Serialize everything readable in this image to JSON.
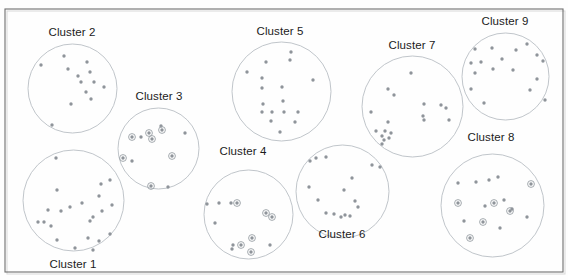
{
  "figure": {
    "title": "",
    "background_color": "#fefefe",
    "frame_color": "#6e6e6e",
    "outline_color": "#b9bec4",
    "dot_color": "#8f949a",
    "ring_color": "#9aa0a6",
    "label_color": "#1b1b1b",
    "frame": {
      "x": 5,
      "y": 9,
      "width": 558,
      "height": 263
    }
  },
  "labels": {
    "cluster1": "Cluster 1",
    "cluster2": "Cluster 2",
    "cluster3": "Cluster 3",
    "cluster4": "Cluster 4",
    "cluster5": "Cluster 5",
    "cluster6": "Cluster 6",
    "cluster7": "Cluster 7",
    "cluster8": "Cluster 8",
    "cluster9": "Cluster 9"
  },
  "chart_data": {
    "type": "scatter",
    "title": "",
    "xlabel": "",
    "ylabel": "",
    "grid": false,
    "legend": "none",
    "xlim": [
      0,
      568
    ],
    "ylim": [
      0,
      280
    ],
    "note": "Nine circular cluster boundaries each enclosing scatter points; some points carry an outer ring marker.",
    "series": [
      {
        "name": "Cluster 1",
        "label": "Cluster 1",
        "label_pos": {
          "x": 73,
          "y": 268
        },
        "circle": {
          "cx": 73.5,
          "cy": 200.5,
          "r": 50.5
        },
        "points": [
          {
            "x": 56,
            "y": 158,
            "ring": false
          },
          {
            "x": 110,
            "y": 180,
            "ring": false
          },
          {
            "x": 101,
            "y": 184,
            "ring": false
          },
          {
            "x": 57,
            "y": 190,
            "ring": false
          },
          {
            "x": 82,
            "y": 203,
            "ring": false
          },
          {
            "x": 99,
            "y": 196,
            "ring": false
          },
          {
            "x": 48,
            "y": 210,
            "ring": false
          },
          {
            "x": 70,
            "y": 207,
            "ring": false
          },
          {
            "x": 61,
            "y": 211,
            "ring": false
          },
          {
            "x": 112,
            "y": 205,
            "ring": false
          },
          {
            "x": 102,
            "y": 211,
            "ring": false
          },
          {
            "x": 93,
            "y": 217,
            "ring": false
          },
          {
            "x": 90,
            "y": 221,
            "ring": false
          },
          {
            "x": 38,
            "y": 222,
            "ring": false
          },
          {
            "x": 44,
            "y": 222,
            "ring": false
          },
          {
            "x": 51,
            "y": 226,
            "ring": false
          },
          {
            "x": 110,
            "y": 234,
            "ring": false
          },
          {
            "x": 88,
            "y": 238,
            "ring": false
          },
          {
            "x": 99,
            "y": 241,
            "ring": false
          },
          {
            "x": 57,
            "y": 240,
            "ring": false
          },
          {
            "x": 93,
            "y": 250,
            "ring": false
          },
          {
            "x": 75,
            "y": 248,
            "ring": false
          }
        ]
      },
      {
        "name": "Cluster 2",
        "label": "Cluster 2",
        "label_pos": {
          "x": 72,
          "y": 36
        },
        "circle": {
          "cx": 72.5,
          "cy": 88.5,
          "r": 44.5
        },
        "points": [
          {
            "x": 64,
            "y": 56,
            "ring": false
          },
          {
            "x": 41,
            "y": 65,
            "ring": false
          },
          {
            "x": 68,
            "y": 69,
            "ring": false
          },
          {
            "x": 87,
            "y": 62,
            "ring": false
          },
          {
            "x": 78,
            "y": 76,
            "ring": false
          },
          {
            "x": 90,
            "y": 72,
            "ring": false
          },
          {
            "x": 81,
            "y": 82,
            "ring": false
          },
          {
            "x": 94,
            "y": 82,
            "ring": false
          },
          {
            "x": 104,
            "y": 87,
            "ring": false
          },
          {
            "x": 86,
            "y": 92,
            "ring": false
          },
          {
            "x": 91,
            "y": 99,
            "ring": false
          },
          {
            "x": 71,
            "y": 104,
            "ring": false
          },
          {
            "x": 52,
            "y": 125,
            "ring": false
          }
        ]
      },
      {
        "name": "Cluster 3",
        "label": "Cluster 3",
        "label_pos": {
          "x": 159,
          "y": 100
        },
        "circle": {
          "cx": 158.5,
          "cy": 148.5,
          "r": 40.5
        },
        "points": [
          {
            "x": 161,
            "y": 126,
            "ring": false
          },
          {
            "x": 162,
            "y": 130,
            "ring": true
          },
          {
            "x": 149,
            "y": 133,
            "ring": true
          },
          {
            "x": 132,
            "y": 137,
            "ring": true
          },
          {
            "x": 141,
            "y": 137,
            "ring": false
          },
          {
            "x": 152,
            "y": 139,
            "ring": true
          },
          {
            "x": 185,
            "y": 133,
            "ring": false
          },
          {
            "x": 123,
            "y": 158,
            "ring": true
          },
          {
            "x": 132,
            "y": 161,
            "ring": false
          },
          {
            "x": 172,
            "y": 156,
            "ring": true
          },
          {
            "x": 151,
            "y": 186,
            "ring": true
          },
          {
            "x": 168,
            "y": 187,
            "ring": false
          }
        ]
      },
      {
        "name": "Cluster 4",
        "label": "Cluster 4",
        "label_pos": {
          "x": 243,
          "y": 155
        },
        "circle": {
          "cx": 248.5,
          "cy": 214.5,
          "r": 44.5
        },
        "points": [
          {
            "x": 207,
            "y": 204,
            "ring": false
          },
          {
            "x": 219,
            "y": 203,
            "ring": false
          },
          {
            "x": 231,
            "y": 203,
            "ring": false
          },
          {
            "x": 237,
            "y": 203,
            "ring": true
          },
          {
            "x": 266,
            "y": 213,
            "ring": true
          },
          {
            "x": 272,
            "y": 217,
            "ring": true
          },
          {
            "x": 215,
            "y": 223,
            "ring": false
          },
          {
            "x": 252,
            "y": 238,
            "ring": true
          },
          {
            "x": 233,
            "y": 245,
            "ring": false
          },
          {
            "x": 241,
            "y": 245,
            "ring": true
          },
          {
            "x": 232,
            "y": 249,
            "ring": false
          },
          {
            "x": 251,
            "y": 252,
            "ring": true
          },
          {
            "x": 270,
            "y": 245,
            "ring": false
          }
        ]
      },
      {
        "name": "Cluster 5",
        "label": "Cluster 5",
        "label_pos": {
          "x": 280,
          "y": 35
        },
        "circle": {
          "cx": 281.5,
          "cy": 91.5,
          "r": 49.5
        },
        "points": [
          {
            "x": 291,
            "y": 52,
            "ring": false
          },
          {
            "x": 290,
            "y": 60,
            "ring": false
          },
          {
            "x": 266,
            "y": 62,
            "ring": false
          },
          {
            "x": 247,
            "y": 72,
            "ring": false
          },
          {
            "x": 262,
            "y": 78,
            "ring": false
          },
          {
            "x": 313,
            "y": 80,
            "ring": false
          },
          {
            "x": 262,
            "y": 88,
            "ring": false
          },
          {
            "x": 282,
            "y": 87,
            "ring": false
          },
          {
            "x": 283,
            "y": 101,
            "ring": false
          },
          {
            "x": 263,
            "y": 104,
            "ring": false
          },
          {
            "x": 262,
            "y": 112,
            "ring": false
          },
          {
            "x": 272,
            "y": 112,
            "ring": false
          },
          {
            "x": 284,
            "y": 112,
            "ring": false
          },
          {
            "x": 298,
            "y": 112,
            "ring": false
          },
          {
            "x": 271,
            "y": 121,
            "ring": false
          },
          {
            "x": 295,
            "y": 122,
            "ring": false
          },
          {
            "x": 280,
            "y": 132,
            "ring": false
          }
        ]
      },
      {
        "name": "Cluster 6",
        "label": "Cluster 6",
        "label_pos": {
          "x": 342,
          "y": 238
        },
        "circle": {
          "cx": 342.5,
          "cy": 191.5,
          "r": 46.5
        },
        "points": [
          {
            "x": 310,
            "y": 161,
            "ring": false
          },
          {
            "x": 316,
            "y": 158,
            "ring": false
          },
          {
            "x": 326,
            "y": 157,
            "ring": false
          },
          {
            "x": 372,
            "y": 165,
            "ring": false
          },
          {
            "x": 380,
            "y": 167,
            "ring": false
          },
          {
            "x": 352,
            "y": 178,
            "ring": false
          },
          {
            "x": 309,
            "y": 187,
            "ring": false
          },
          {
            "x": 344,
            "y": 190,
            "ring": false
          },
          {
            "x": 318,
            "y": 200,
            "ring": false
          },
          {
            "x": 355,
            "y": 201,
            "ring": false
          },
          {
            "x": 358,
            "y": 207,
            "ring": false
          },
          {
            "x": 326,
            "y": 213,
            "ring": false
          },
          {
            "x": 334,
            "y": 214,
            "ring": false
          },
          {
            "x": 341,
            "y": 217,
            "ring": false
          },
          {
            "x": 345,
            "y": 215,
            "ring": false
          },
          {
            "x": 350,
            "y": 216,
            "ring": false
          }
        ]
      },
      {
        "name": "Cluster 7",
        "label": "Cluster 7",
        "label_pos": {
          "x": 412,
          "y": 49
        },
        "circle": {
          "cx": 412.5,
          "cy": 106.5,
          "r": 50.5
        },
        "points": [
          {
            "x": 411,
            "y": 73,
            "ring": false
          },
          {
            "x": 388,
            "y": 89,
            "ring": false
          },
          {
            "x": 394,
            "y": 95,
            "ring": false
          },
          {
            "x": 424,
            "y": 104,
            "ring": false
          },
          {
            "x": 441,
            "y": 105,
            "ring": false
          },
          {
            "x": 446,
            "y": 108,
            "ring": false
          },
          {
            "x": 371,
            "y": 112,
            "ring": false
          },
          {
            "x": 423,
            "y": 116,
            "ring": false
          },
          {
            "x": 424,
            "y": 120,
            "ring": false
          },
          {
            "x": 449,
            "y": 120,
            "ring": false
          },
          {
            "x": 388,
            "y": 122,
            "ring": false
          },
          {
            "x": 376,
            "y": 131,
            "ring": false
          },
          {
            "x": 385,
            "y": 131,
            "ring": false
          },
          {
            "x": 391,
            "y": 133,
            "ring": false
          },
          {
            "x": 382,
            "y": 136,
            "ring": false
          },
          {
            "x": 389,
            "y": 138,
            "ring": false
          },
          {
            "x": 384,
            "y": 140,
            "ring": false
          },
          {
            "x": 382,
            "y": 144,
            "ring": false
          }
        ]
      },
      {
        "name": "Cluster 8",
        "label": "Cluster 8",
        "label_pos": {
          "x": 491,
          "y": 141
        },
        "circle": {
          "cx": 492.5,
          "cy": 205.5,
          "r": 51.5
        },
        "points": [
          {
            "x": 498,
            "y": 177,
            "ring": false
          },
          {
            "x": 458,
            "y": 183,
            "ring": false
          },
          {
            "x": 476,
            "y": 182,
            "ring": false
          },
          {
            "x": 489,
            "y": 180,
            "ring": false
          },
          {
            "x": 531,
            "y": 184,
            "ring": true
          },
          {
            "x": 458,
            "y": 203,
            "ring": true
          },
          {
            "x": 485,
            "y": 206,
            "ring": false
          },
          {
            "x": 494,
            "y": 203,
            "ring": true
          },
          {
            "x": 504,
            "y": 200,
            "ring": false
          },
          {
            "x": 510,
            "y": 211,
            "ring": true
          },
          {
            "x": 512,
            "y": 209,
            "ring": false
          },
          {
            "x": 464,
            "y": 221,
            "ring": false
          },
          {
            "x": 483,
            "y": 222,
            "ring": true
          },
          {
            "x": 527,
            "y": 217,
            "ring": false
          },
          {
            "x": 500,
            "y": 228,
            "ring": false
          },
          {
            "x": 470,
            "y": 238,
            "ring": true
          }
        ]
      },
      {
        "name": "Cluster 9",
        "label": "Cluster 9",
        "label_pos": {
          "x": 505,
          "y": 25
        },
        "circle": {
          "cx": 505.5,
          "cy": 76.5,
          "r": 43.5
        },
        "points": [
          {
            "x": 527,
            "y": 44,
            "ring": false
          },
          {
            "x": 475,
            "y": 49,
            "ring": false
          },
          {
            "x": 492,
            "y": 48,
            "ring": false
          },
          {
            "x": 516,
            "y": 50,
            "ring": false
          },
          {
            "x": 537,
            "y": 55,
            "ring": false
          },
          {
            "x": 502,
            "y": 59,
            "ring": false
          },
          {
            "x": 543,
            "y": 61,
            "ring": false
          },
          {
            "x": 471,
            "y": 63,
            "ring": false
          },
          {
            "x": 481,
            "y": 62,
            "ring": false
          },
          {
            "x": 493,
            "y": 69,
            "ring": false
          },
          {
            "x": 513,
            "y": 70,
            "ring": false
          },
          {
            "x": 475,
            "y": 73,
            "ring": false
          },
          {
            "x": 537,
            "y": 79,
            "ring": false
          },
          {
            "x": 471,
            "y": 89,
            "ring": false
          },
          {
            "x": 530,
            "y": 90,
            "ring": false
          },
          {
            "x": 545,
            "y": 100,
            "ring": false
          },
          {
            "x": 484,
            "y": 103,
            "ring": false
          }
        ]
      }
    ]
  }
}
